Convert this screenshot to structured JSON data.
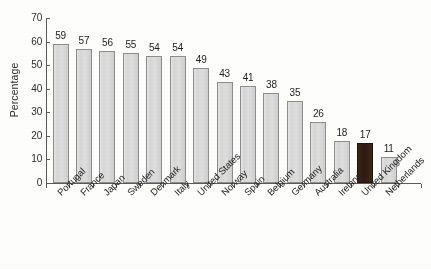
{
  "chart_data": {
    "type": "bar",
    "title": "",
    "xlabel": "",
    "ylabel": "Percentage",
    "ylim": [
      0,
      70
    ],
    "ytick_values": [
      0,
      10,
      20,
      30,
      40,
      50,
      60,
      70
    ],
    "grid": false,
    "legend": null,
    "categories": [
      "Portugal",
      "France",
      "Japan",
      "Sweden",
      "Denmark",
      "Italy",
      "United States",
      "Norway",
      "Spain",
      "Belgium",
      "Germany",
      "Australia",
      "Ireland",
      "United Kingdom",
      "Netherlands"
    ],
    "values": [
      59,
      57,
      56,
      55,
      54,
      54,
      49,
      43,
      41,
      38,
      35,
      26,
      18,
      17,
      11
    ],
    "highlighted_category": "United Kingdom",
    "bar_value_labels": [
      "59",
      "57",
      "56",
      "55",
      "54",
      "54",
      "49",
      "43",
      "41",
      "38",
      "35",
      "26",
      "18",
      "17",
      "11"
    ],
    "colors": {
      "bar_fill": "#d8d8d8",
      "bar_stroke": "#8d8d8d",
      "highlight_fill": "#321e13",
      "axis": "#5a5a5a",
      "text": "#232323",
      "background": "#fdfdfc"
    }
  }
}
